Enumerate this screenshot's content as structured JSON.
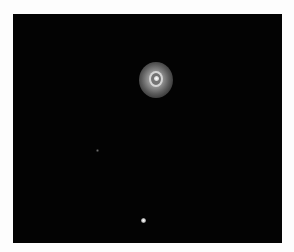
{
  "image": {
    "subject": "planetary nebula on black sky",
    "colors": {
      "border": "#fdfdfd",
      "sky": "#030303",
      "nebula_halo": "#aaaaaa",
      "nebula_core": "#ffffff"
    },
    "objects": [
      {
        "name": "planetary-nebula",
        "cx": 155,
        "cy": 80
      },
      {
        "name": "faint-star",
        "cx": 97,
        "cy": 150
      },
      {
        "name": "bright-star",
        "cx": 143,
        "cy": 220
      }
    ]
  }
}
